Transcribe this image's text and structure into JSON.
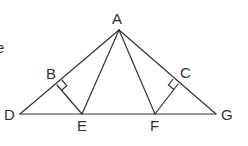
{
  "diagram": {
    "type": "geometry",
    "stroke_color": "#333333",
    "background": "#ffffff",
    "partial_text": "e",
    "points": {
      "A": {
        "label": "A",
        "x": 119,
        "y": 30
      },
      "D": {
        "label": "D",
        "x": 20,
        "y": 114
      },
      "E": {
        "label": "E",
        "x": 82,
        "y": 114
      },
      "F": {
        "label": "F",
        "x": 155,
        "y": 114
      },
      "G": {
        "label": "G",
        "x": 216,
        "y": 114
      },
      "B": {
        "label": "B",
        "x": 57,
        "y": 85
      },
      "C": {
        "label": "C",
        "x": 178,
        "y": 84
      }
    },
    "labels": {
      "A": "A",
      "B": "B",
      "C": "C",
      "D": "D",
      "E": "E",
      "F": "F",
      "G": "G"
    },
    "segments": [
      "AD",
      "AG",
      "DG",
      "AE",
      "AF",
      "BE",
      "CF"
    ],
    "right_angles": [
      "B",
      "C"
    ]
  }
}
